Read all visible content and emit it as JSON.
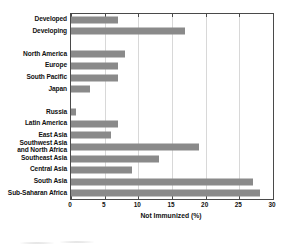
{
  "chart_data": {
    "type": "bar",
    "orientation": "horizontal",
    "title": "",
    "xlabel": "Not Immunized  (%)",
    "ylabel": "",
    "xlim": [
      0,
      30
    ],
    "xticks": [
      "0",
      "5",
      "10",
      "15",
      "20",
      "25",
      "30"
    ],
    "grid": true,
    "legend": null,
    "bar_color": "#8a8a8a",
    "categories": [
      "Developed",
      "Developing",
      "",
      "North America",
      "Europe",
      "South Pacific",
      "Japan",
      "",
      "Russia",
      "Latin America",
      "East Asia",
      "Southwest Asia\nand North Africa",
      "Southeast Asia",
      "Central Asia",
      "South Asia",
      "Sub-Saharan Africa"
    ],
    "values": [
      7.0,
      17.0,
      null,
      8.0,
      7.0,
      7.0,
      2.8,
      null,
      0.7,
      7.0,
      6.0,
      19.0,
      13.0,
      9.0,
      27.0,
      28.0
    ],
    "bars": [
      {
        "label": "Developed",
        "value": 7.0
      },
      {
        "label": "Developing",
        "value": 17.0
      },
      {
        "label": "North America",
        "value": 8.0
      },
      {
        "label": "Europe",
        "value": 7.0
      },
      {
        "label": "South Pacific",
        "value": 7.0
      },
      {
        "label": "Japan",
        "value": 2.8
      },
      {
        "label": "Russia",
        "value": 0.7
      },
      {
        "label": "Latin America",
        "value": 7.0
      },
      {
        "label": "East Asia",
        "value": 6.0
      },
      {
        "label": "Southwest Asia and North Africa",
        "value": 19.0
      },
      {
        "label": "Southeast Asia",
        "value": 13.0
      },
      {
        "label": "Central Asia",
        "value": 9.0
      },
      {
        "label": "South Asia",
        "value": 27.0
      },
      {
        "label": "Sub-Saharan Africa",
        "value": 28.0
      }
    ]
  },
  "labels": {
    "developed": "Developed",
    "developing": "Developing",
    "north_america": "North America",
    "europe": "Europe",
    "south_pacific": "South Pacific",
    "japan": "Japan",
    "russia": "Russia",
    "latin_america": "Latin America",
    "east_asia": "East Asia",
    "southwest_asia_line1": "Southwest Asia",
    "southwest_asia_line2": "and North Africa",
    "southeast_asia": "Southeast Asia",
    "central_asia": "Central Asia",
    "south_asia": "South Asia",
    "sub_saharan_africa": "Sub-Saharan Africa"
  },
  "axis": {
    "title": "Not Immunized  (%)",
    "tick_0": "0",
    "tick_5": "5",
    "tick_10": "10",
    "tick_15": "15",
    "tick_20": "20",
    "tick_25": "25",
    "tick_30": "30"
  }
}
